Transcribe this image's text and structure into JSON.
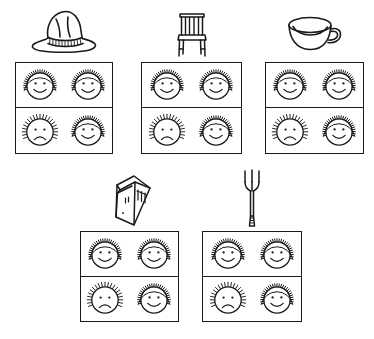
{
  "worksheet": {
    "title": "Object preference rating worksheet",
    "background_color": "#ffffff",
    "ink_color": "#1a1a1a",
    "face_legend": {
      "happy": "happy-face-curly-hair",
      "sad": "sad-face-spiky-hair"
    },
    "grid_description": "2 by 2 grid of four faces per item",
    "items": [
      {
        "id": "item-hat",
        "object_label": "hat",
        "object_icon": "hat-icon",
        "row": 1,
        "column": 1,
        "box": {
          "left": 15,
          "top": 62,
          "width": 98,
          "height": 92
        },
        "stimulus": {
          "top": 5,
          "width": 76,
          "height": 52
        },
        "faces": [
          {
            "position": "top-left",
            "expression": "happy",
            "hair": "curly",
            "icon": "happy-face-icon"
          },
          {
            "position": "top-right",
            "expression": "happy",
            "hair": "curly",
            "icon": "happy-face-icon"
          },
          {
            "position": "bottom-left",
            "expression": "sad",
            "hair": "spiky",
            "icon": "sad-face-icon"
          },
          {
            "position": "bottom-right",
            "expression": "happy",
            "hair": "curly",
            "icon": "happy-face-icon"
          }
        ]
      },
      {
        "id": "item-chair",
        "object_label": "chair",
        "object_icon": "chair-icon",
        "row": 1,
        "column": 2,
        "box": {
          "left": 141,
          "top": 62,
          "width": 101,
          "height": 92
        },
        "stimulus": {
          "top": 6,
          "width": 44,
          "height": 52
        },
        "faces": [
          {
            "position": "top-left",
            "expression": "happy",
            "hair": "curly",
            "icon": "happy-face-icon"
          },
          {
            "position": "top-right",
            "expression": "happy",
            "hair": "curly",
            "icon": "happy-face-icon"
          },
          {
            "position": "bottom-left",
            "expression": "sad",
            "hair": "spiky",
            "icon": "sad-face-icon"
          },
          {
            "position": "bottom-right",
            "expression": "happy",
            "hair": "curly",
            "icon": "happy-face-icon"
          }
        ]
      },
      {
        "id": "item-cup",
        "object_label": "cup",
        "object_icon": "cup-icon",
        "row": 1,
        "column": 3,
        "box": {
          "left": 265,
          "top": 62,
          "width": 99,
          "height": 92
        },
        "stimulus": {
          "top": 12,
          "width": 62,
          "height": 44
        },
        "faces": [
          {
            "position": "top-left",
            "expression": "happy",
            "hair": "curly",
            "icon": "happy-face-icon"
          },
          {
            "position": "top-right",
            "expression": "happy",
            "hair": "curly",
            "icon": "happy-face-icon"
          },
          {
            "position": "bottom-left",
            "expression": "sad",
            "hair": "spiky",
            "icon": "sad-face-icon"
          },
          {
            "position": "bottom-right",
            "expression": "happy",
            "hair": "curly",
            "icon": "happy-face-icon"
          }
        ]
      },
      {
        "id": "item-book",
        "object_label": "book",
        "object_icon": "book-icon",
        "row": 2,
        "column": 1,
        "box": {
          "left": 80,
          "top": 231,
          "width": 99,
          "height": 91
        },
        "stimulus": {
          "top": 172,
          "width": 52,
          "height": 58
        },
        "faces": [
          {
            "position": "top-left",
            "expression": "happy",
            "hair": "curly",
            "icon": "happy-face-icon"
          },
          {
            "position": "top-right",
            "expression": "happy",
            "hair": "curly",
            "icon": "happy-face-icon"
          },
          {
            "position": "bottom-left",
            "expression": "sad",
            "hair": "spiky",
            "icon": "sad-face-icon"
          },
          {
            "position": "bottom-right",
            "expression": "happy",
            "hair": "curly",
            "icon": "happy-face-icon"
          }
        ]
      },
      {
        "id": "item-fork",
        "object_label": "fork",
        "object_icon": "fork-icon",
        "row": 2,
        "column": 2,
        "box": {
          "left": 202,
          "top": 231,
          "width": 100,
          "height": 91
        },
        "stimulus": {
          "top": 168,
          "width": 22,
          "height": 62
        },
        "faces": [
          {
            "position": "top-left",
            "expression": "happy",
            "hair": "curly",
            "icon": "happy-face-icon"
          },
          {
            "position": "top-right",
            "expression": "happy",
            "hair": "curly",
            "icon": "happy-face-icon"
          },
          {
            "position": "bottom-left",
            "expression": "sad",
            "hair": "spiky",
            "icon": "sad-face-icon"
          },
          {
            "position": "bottom-right",
            "expression": "happy",
            "hair": "curly",
            "icon": "happy-face-icon"
          }
        ]
      }
    ]
  }
}
